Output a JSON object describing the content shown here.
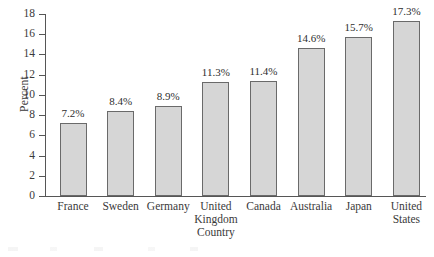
{
  "chart_data": {
    "type": "bar",
    "title": "",
    "xlabel": "Country",
    "ylabel": "Percent",
    "ylim": [
      0,
      18
    ],
    "ytick_step": 2,
    "grid": false,
    "legend": null,
    "categories": [
      "France",
      "Sweden",
      "Germany",
      "United\nKingdom",
      "Canada",
      "Australia",
      "Japan",
      "United\nStates"
    ],
    "values": [
      7.2,
      8.4,
      8.9,
      11.3,
      11.4,
      14.6,
      15.7,
      17.3
    ],
    "data_labels": [
      "7.2%",
      "8.4%",
      "8.9%",
      "11.3%",
      "11.4%",
      "14.6%",
      "15.7%",
      "17.3%"
    ],
    "ytick_labels": [
      "0",
      "2",
      "4",
      "6",
      "8",
      "10",
      "12",
      "14",
      "16",
      "18"
    ],
    "colors": {
      "bar_fill": "#d6d6d6",
      "bar_edge": "#6a6a6a",
      "axis": "#565656",
      "text": "#3a3a3a",
      "background": "#ffffff"
    }
  }
}
